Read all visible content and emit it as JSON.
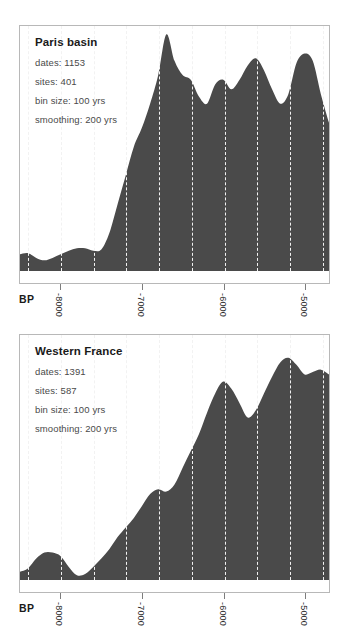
{
  "figure": {
    "background_color": "#ffffff",
    "fill_color": "#4a4a4a",
    "panel_border_color": "#b8b8b8",
    "gridline_color": "#f2f2f2"
  },
  "panels": [
    {
      "id": "paris-basin",
      "title": "Paris basin",
      "meta": [
        "dates: 1153",
        "sites: 401",
        "bin size: 100 yrs",
        "smoothing: 200 yrs"
      ],
      "axis_label": "BP",
      "tick_labels": [
        "-8000",
        "-7000",
        "-6000",
        "-5000"
      ]
    },
    {
      "id": "western-france",
      "title": "Western France",
      "meta": [
        "dates: 1391",
        "sites: 587",
        "bin size: 100 yrs",
        "smoothing: 200 yrs"
      ],
      "axis_label": "BP",
      "tick_labels": [
        "-8000",
        "-7000",
        "-6000",
        "-5000"
      ]
    }
  ],
  "chart_data": [
    {
      "type": "area",
      "title": "Paris basin",
      "subtitle": "dates: 1153 | sites: 401 | bin size: 100 yrs | smoothing: 200 yrs",
      "xlabel": "BP",
      "ylabel": "Summed probability density",
      "xlim": [
        -8500,
        -4700
      ],
      "ylim": [
        0,
        1
      ],
      "grid": true,
      "legend": "none",
      "xticks": [
        -8000,
        -7000,
        -6000,
        -5000
      ],
      "xticklabels": [
        "-8000",
        "-7000",
        "-6000",
        "-5000"
      ],
      "gridline_x": [
        -8400,
        -8000,
        -7600,
        -7200,
        -6800,
        -6400,
        -6000,
        -5600,
        -5200,
        -4800
      ],
      "x": [
        -8500,
        -8400,
        -8300,
        -8200,
        -8100,
        -8000,
        -7900,
        -7800,
        -7700,
        -7600,
        -7500,
        -7400,
        -7300,
        -7200,
        -7100,
        -7000,
        -6900,
        -6800,
        -6700,
        -6600,
        -6500,
        -6400,
        -6300,
        -6200,
        -6100,
        -6000,
        -5900,
        -5800,
        -5700,
        -5600,
        -5500,
        -5400,
        -5300,
        -5200,
        -5100,
        -5000,
        -4900,
        -4800,
        -4700
      ],
      "values": [
        0.07,
        0.075,
        0.055,
        0.045,
        0.055,
        0.07,
        0.085,
        0.095,
        0.095,
        0.085,
        0.09,
        0.16,
        0.28,
        0.4,
        0.52,
        0.6,
        0.7,
        0.82,
        0.99,
        0.88,
        0.82,
        0.8,
        0.73,
        0.7,
        0.78,
        0.8,
        0.76,
        0.8,
        0.86,
        0.89,
        0.84,
        0.76,
        0.7,
        0.74,
        0.87,
        0.91,
        0.88,
        0.74,
        0.62
      ]
    },
    {
      "type": "area",
      "title": "Western France",
      "subtitle": "dates: 1391 | sites: 587 | bin size: 100 yrs | smoothing: 200 yrs",
      "xlabel": "BP",
      "ylabel": "Summed probability density",
      "xlim": [
        -8500,
        -4700
      ],
      "ylim": [
        0,
        1
      ],
      "grid": true,
      "legend": "none",
      "xticks": [
        -8000,
        -7000,
        -6000,
        -5000
      ],
      "xticklabels": [
        "-8000",
        "-7000",
        "-6000",
        "-5000"
      ],
      "gridline_x": [
        -8400,
        -8000,
        -7600,
        -7200,
        -6800,
        -6400,
        -6000,
        -5600,
        -5200,
        -4800
      ],
      "x": [
        -8500,
        -8400,
        -8300,
        -8200,
        -8100,
        -8000,
        -7900,
        -7800,
        -7700,
        -7600,
        -7500,
        -7400,
        -7300,
        -7200,
        -7100,
        -7000,
        -6900,
        -6800,
        -6700,
        -6600,
        -6500,
        -6400,
        -6300,
        -6200,
        -6100,
        -6000,
        -5900,
        -5800,
        -5700,
        -5600,
        -5500,
        -5400,
        -5300,
        -5200,
        -5100,
        -5000,
        -4900,
        -4800,
        -4700
      ],
      "values": [
        0.035,
        0.05,
        0.09,
        0.115,
        0.115,
        0.1,
        0.055,
        0.02,
        0.025,
        0.055,
        0.09,
        0.13,
        0.18,
        0.22,
        0.26,
        0.31,
        0.36,
        0.38,
        0.37,
        0.4,
        0.47,
        0.54,
        0.61,
        0.7,
        0.78,
        0.83,
        0.8,
        0.74,
        0.68,
        0.71,
        0.78,
        0.85,
        0.91,
        0.93,
        0.9,
        0.86,
        0.87,
        0.88,
        0.86
      ]
    }
  ]
}
